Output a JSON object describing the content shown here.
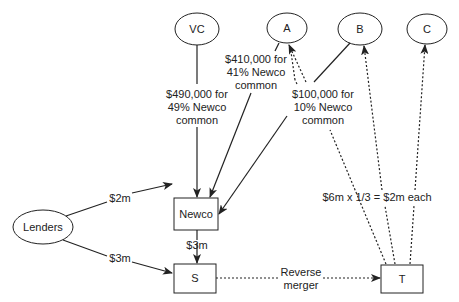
{
  "nodes": {
    "vc": "VC",
    "a": "A",
    "b": "B",
    "c": "C",
    "newco": "Newco",
    "lenders": "Lenders",
    "s": "S",
    "t": "T"
  },
  "edges": {
    "vc_newco": [
      "$490,000 for",
      "49% Newco",
      "common"
    ],
    "a_newco": [
      "$410,000 for",
      "41% Newco",
      "common"
    ],
    "b_newco": [
      "$100,000 for",
      "10% Newco",
      "common"
    ],
    "lenders_newco": "$2m",
    "lenders_s": "$3m",
    "newco_s": "$3m",
    "s_t": [
      "Reverse",
      "merger"
    ],
    "t_shareholders": "$6m x 1/3 = $2m each"
  },
  "colors": {
    "stroke": "#222222",
    "background": "#ffffff"
  }
}
